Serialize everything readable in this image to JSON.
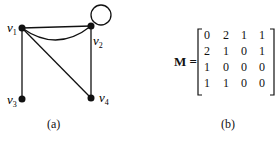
{
  "figure_a": {
    "caption": "(a)",
    "vertices": [
      {
        "id": "v1",
        "label": "v",
        "sub": "1"
      },
      {
        "id": "v2",
        "label": "v",
        "sub": "2"
      },
      {
        "id": "v3",
        "label": "v",
        "sub": "3"
      },
      {
        "id": "v4",
        "label": "v",
        "sub": "4"
      }
    ],
    "edges": [
      [
        "v1",
        "v2"
      ],
      [
        "v1",
        "v2"
      ],
      [
        "v2",
        "v2"
      ],
      [
        "v1",
        "v3"
      ],
      [
        "v1",
        "v4"
      ],
      [
        "v2",
        "v4"
      ]
    ]
  },
  "figure_b": {
    "caption": "(b)",
    "matrix_label": "M =",
    "matrix": [
      [
        "0",
        "2",
        "1",
        "1"
      ],
      [
        "2",
        "1",
        "0",
        "1"
      ],
      [
        "1",
        "0",
        "0",
        "0"
      ],
      [
        "1",
        "1",
        "0",
        "0"
      ]
    ]
  }
}
